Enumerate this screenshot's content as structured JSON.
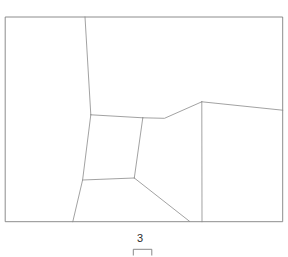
{
  "figure": {
    "type": "parcel-boundary-map",
    "background_color": "#ffffff",
    "line_color": "#808080",
    "interior_line_color": "#8a8a8a"
  },
  "frame": {
    "name": "map-frame",
    "x": 5.7,
    "y": 17.0,
    "width": 277.0,
    "height": 204.7,
    "path": "M 5.7 17.0 L 282.7 17.0 L 282.7 221.7 L 5.7 221.7 Z"
  },
  "interior_lines": [
    {
      "name": "upper-vertical-divider",
      "path": "M 85.0 17.0 L 90.8 114.8",
      "from": [
        85.0,
        17.0
      ],
      "to": [
        90.8,
        114.8
      ]
    },
    {
      "name": "central-quad-top-edge",
      "path": "M 90.8 114.8 L 142.8 117.8",
      "from": [
        90.8,
        114.8
      ],
      "to": [
        142.8,
        117.8
      ]
    },
    {
      "name": "ridge-line-to-peak",
      "path": "M 142.8 117.8 L 164.5 118.3 L 201.8 101.8",
      "points": [
        [
          142.8,
          117.8
        ],
        [
          164.5,
          118.3
        ],
        [
          201.8,
          101.8
        ]
      ]
    },
    {
      "name": "peak-to-right-border",
      "path": "M 201.8 101.8 L 282.7 110.2",
      "from": [
        201.8,
        101.8
      ],
      "to": [
        282.7,
        110.2
      ]
    },
    {
      "name": "right-vertical-divider",
      "path": "M 201.8 101.8 L 202.0 221.7",
      "from": [
        201.8,
        101.8
      ],
      "to": [
        202.0,
        221.7
      ]
    },
    {
      "name": "central-quad-right-edge",
      "path": "M 142.8 117.8 L 134.3 178.0",
      "from": [
        142.8,
        117.8
      ],
      "to": [
        134.3,
        178.0
      ]
    },
    {
      "name": "left-divider-to-bottom",
      "path": "M 90.8 114.8 L 82.6 180.0 L 72.8 221.7",
      "points": [
        [
          90.8,
          114.8
        ],
        [
          82.6,
          180.0
        ],
        [
          72.8,
          221.7
        ]
      ]
    },
    {
      "name": "central-quad-bottom-edge",
      "path": "M 82.6 180.0 L 134.3 178.0",
      "from": [
        82.6,
        180.0
      ],
      "to": [
        134.3,
        178.0
      ]
    },
    {
      "name": "diagonal-to-bottom-border",
      "path": "M 134.3 178.0 L 189.5 221.3",
      "from": [
        134.3,
        178.0
      ],
      "to": [
        189.5,
        221.3
      ]
    }
  ],
  "regions": [
    {
      "name": "region-upper-left",
      "label": ""
    },
    {
      "name": "region-upper-center",
      "label": ""
    },
    {
      "name": "region-right",
      "label": ""
    },
    {
      "name": "region-center-quad",
      "label": ""
    },
    {
      "name": "region-lower-left",
      "label": ""
    },
    {
      "name": "region-lower-center",
      "label": ""
    }
  ],
  "scalebar": {
    "name": "scale-bar",
    "label": "3",
    "label_x": 140.0,
    "label_y": 234.0,
    "bar_left": 133.0,
    "bar_right": 152.0,
    "bar_top": 249.0,
    "bar_bottom": 255.0,
    "path": "M 133.3 255.0 L 133.3 249.3 L 151.8 249.3 L 151.8 255.0"
  }
}
